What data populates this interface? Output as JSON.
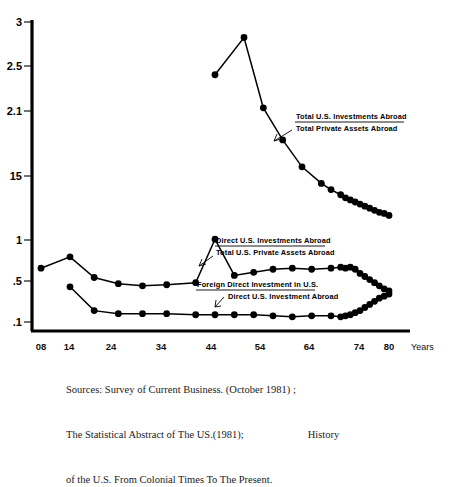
{
  "chart_data": {
    "type": "line",
    "title": "",
    "subtitle": "",
    "xlabel": "Years",
    "ylabel": "",
    "xlim": [
      1904,
      1984
    ],
    "ylim": [
      0.1,
      3.0
    ],
    "grid": false,
    "legend_position": "inline-annotations",
    "y_tick_labels": [
      "3",
      "2.5",
      "2.1",
      "15",
      "1",
      ".5",
      ".1"
    ],
    "y_tick_values": [
      3.0,
      2.5,
      2.1,
      1.5,
      1.0,
      0.5,
      0.1
    ],
    "x_tick_labels": [
      "08",
      "14",
      "24",
      "34",
      "44",
      "54",
      "64",
      "74",
      "80"
    ],
    "x_tick_values": [
      1908,
      1914,
      1924,
      1934,
      1944,
      1954,
      1964,
      1974,
      1980
    ],
    "series": [
      {
        "name": "Total U.S. Investments Abroad / Total Private Assets Abroad",
        "numerator": "Total U.S. Investments Abroad",
        "denominator": "Total Private Assets Abroad",
        "x": [
          1944,
          1950,
          1954,
          1958,
          1962,
          1966,
          1968,
          1970,
          1971,
          1972,
          1973,
          1974,
          1975,
          1976,
          1977,
          1978,
          1979,
          1980
        ],
        "values": [
          2.49,
          2.85,
          2.17,
          1.86,
          1.6,
          1.44,
          1.38,
          1.33,
          1.3,
          1.28,
          1.26,
          1.24,
          1.22,
          1.2,
          1.18,
          1.16,
          1.15,
          1.13
        ]
      },
      {
        "name": "Direct U.S. Investments Abroad / Total U.S. Private Assets Abroad",
        "numerator": "Direct U.S. Investments Abroad",
        "denominator": "Total U.S. Private Assets Abroad",
        "x": [
          1908,
          1914,
          1919,
          1924,
          1929,
          1934,
          1940,
          1944,
          1948,
          1952,
          1956,
          1960,
          1964,
          1968,
          1970,
          1971,
          1972,
          1973,
          1974,
          1975,
          1976,
          1977,
          1978,
          1979,
          1980
        ],
        "values": [
          0.62,
          0.73,
          0.53,
          0.47,
          0.45,
          0.46,
          0.48,
          0.9,
          0.55,
          0.58,
          0.61,
          0.62,
          0.61,
          0.62,
          0.63,
          0.62,
          0.63,
          0.61,
          0.57,
          0.54,
          0.51,
          0.48,
          0.45,
          0.42,
          0.4
        ]
      },
      {
        "name": "Foreign Direct Investment in U.S. / Direct U.S. Investment Abroad",
        "numerator": "Foreign Direct Investment in U.S.",
        "denominator": "Direct U.S. Investment Abroad",
        "x": [
          1914,
          1919,
          1924,
          1929,
          1934,
          1940,
          1944,
          1948,
          1952,
          1956,
          1960,
          1964,
          1968,
          1970,
          1971,
          1972,
          1973,
          1974,
          1975,
          1976,
          1977,
          1978,
          1979,
          1980
        ],
        "values": [
          0.44,
          0.21,
          0.18,
          0.18,
          0.18,
          0.17,
          0.17,
          0.17,
          0.17,
          0.16,
          0.15,
          0.16,
          0.16,
          0.15,
          0.16,
          0.17,
          0.19,
          0.21,
          0.24,
          0.27,
          0.3,
          0.33,
          0.35,
          0.37
        ]
      }
    ]
  },
  "annotations": {
    "top": {
      "numerator": "Total U.S. Investments Abroad",
      "denominator": "Total Private Assets Abroad"
    },
    "middle": {
      "numerator": "Direct U.S. Investments Abroad",
      "denominator": "Total U.S. Private Assets Abroad"
    },
    "bottom": {
      "numerator": "Foreign Direct Investment in U.S.",
      "denominator": "Direct U.S. Investment Abroad"
    }
  },
  "axis": {
    "x_axis_name": "Years"
  },
  "caption": {
    "line1": "Sources: Survey of Current Business. (October 1981) ;",
    "line2": "The Statistical Abstract of The US.(1981);",
    "line2_tail": "History",
    "line3": "of the U.S. From Colonial Times To The Present."
  }
}
